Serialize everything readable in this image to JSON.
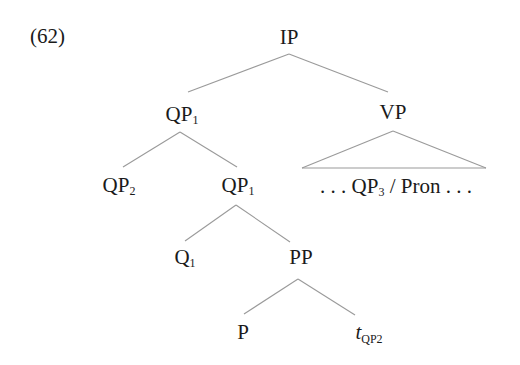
{
  "example_number": "(62)",
  "tree": {
    "root": {
      "label": "IP"
    },
    "qp1_top": {
      "label": "QP",
      "subscript": "1"
    },
    "vp": {
      "label": "VP"
    },
    "qp2": {
      "label": "QP",
      "subscript": "2"
    },
    "qp1_mid": {
      "label": "QP",
      "subscript": "1"
    },
    "vp_yield": {
      "prefix": ". . . ",
      "label": "QP",
      "subscript": "3",
      "suffix": " / Pron . . ."
    },
    "q1": {
      "label": "Q",
      "subscript": "1"
    },
    "pp": {
      "label": "PP"
    },
    "p": {
      "label": "P"
    },
    "trace": {
      "label": "t",
      "subscript": "QP2"
    }
  },
  "edges": [
    [
      "IP",
      "QP1"
    ],
    [
      "IP",
      "VP"
    ],
    [
      "QP1",
      "QP2"
    ],
    [
      "QP1",
      "QP1"
    ],
    [
      "VP",
      "triangle: ... QP3 / Pron ..."
    ],
    [
      "QP1",
      "Q1"
    ],
    [
      "QP1",
      "PP"
    ],
    [
      "PP",
      "P"
    ],
    [
      "PP",
      "t_QP2"
    ]
  ],
  "colors": {
    "text": "#1a1a1a",
    "lines": "#9a9a9a",
    "background": "#ffffff"
  }
}
